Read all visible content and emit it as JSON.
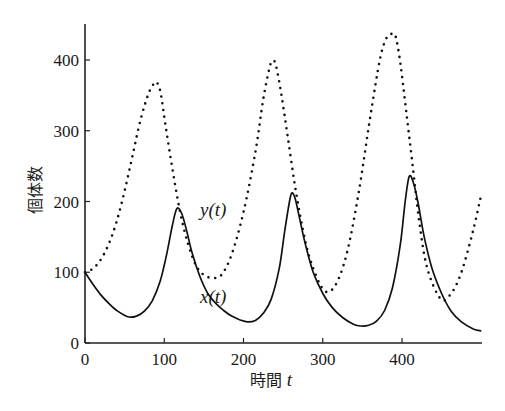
{
  "chart_data": {
    "type": "line",
    "title": "",
    "xlabel": "時間",
    "xlabel_var": "t",
    "ylabel": "個体数",
    "xlim": [
      0,
      500
    ],
    "ylim": [
      0,
      450
    ],
    "xticks": [
      0,
      100,
      200,
      300,
      400
    ],
    "yticks": [
      0,
      100,
      200,
      300,
      400
    ],
    "grid": false,
    "legend": "inline labels",
    "series": [
      {
        "name": "x(t)",
        "style": "solid",
        "label_pos": [
          168,
          76
        ],
        "t": [
          0,
          10,
          20,
          30,
          40,
          54,
          65,
          75,
          85,
          95,
          103,
          110,
          116,
          122,
          128,
          135,
          145,
          155,
          165,
          175,
          185,
          195,
          205,
          215,
          225,
          235,
          245,
          252,
          258,
          261,
          265,
          270,
          278,
          288,
          300,
          312,
          325,
          338,
          348,
          358,
          368,
          378,
          388,
          398,
          404,
          409,
          414,
          420,
          428,
          438,
          450,
          462,
          475,
          490,
          500
        ],
        "values": [
          100,
          83,
          68,
          56,
          46,
          37,
          38,
          45,
          60,
          88,
          125,
          165,
          190,
          183,
          160,
          128,
          94,
          70,
          56,
          46,
          38,
          33,
          30,
          32,
          42,
          62,
          105,
          158,
          200,
          212,
          205,
          180,
          140,
          100,
          70,
          50,
          36,
          27,
          24,
          25,
          31,
          46,
          78,
          140,
          200,
          235,
          228,
          200,
          150,
          105,
          70,
          45,
          30,
          20,
          17
        ]
      },
      {
        "name": "y(t)",
        "style": "dotted",
        "label_pos": [
          165,
          188
        ],
        "t": [
          0,
          10,
          20,
          30,
          40,
          50,
          60,
          70,
          80,
          88,
          92,
          96,
          102,
          110,
          120,
          130,
          140,
          150,
          161,
          172,
          185,
          200,
          215,
          225,
          233,
          237,
          241,
          248,
          256,
          265,
          275,
          285,
          301,
          315,
          330,
          345,
          360,
          372,
          380,
          387,
          392,
          398,
          405,
          413,
          422,
          432,
          449,
          462,
          475,
          490,
          500
        ],
        "values": [
          100,
          105,
          118,
          140,
          172,
          215,
          265,
          315,
          352,
          368,
          366,
          350,
          305,
          248,
          185,
          140,
          110,
          96,
          92,
          96,
          125,
          185,
          270,
          345,
          390,
          399,
          392,
          350,
          290,
          222,
          160,
          115,
          75,
          80,
          125,
          210,
          320,
          400,
          430,
          437,
          433,
          395,
          330,
          255,
          170,
          105,
          62,
          70,
          100,
          160,
          210
        ]
      }
    ],
    "axis_origin_px": [
      85,
      343
    ],
    "px_per_unit": [
      0.7925,
      0.7075
    ]
  }
}
